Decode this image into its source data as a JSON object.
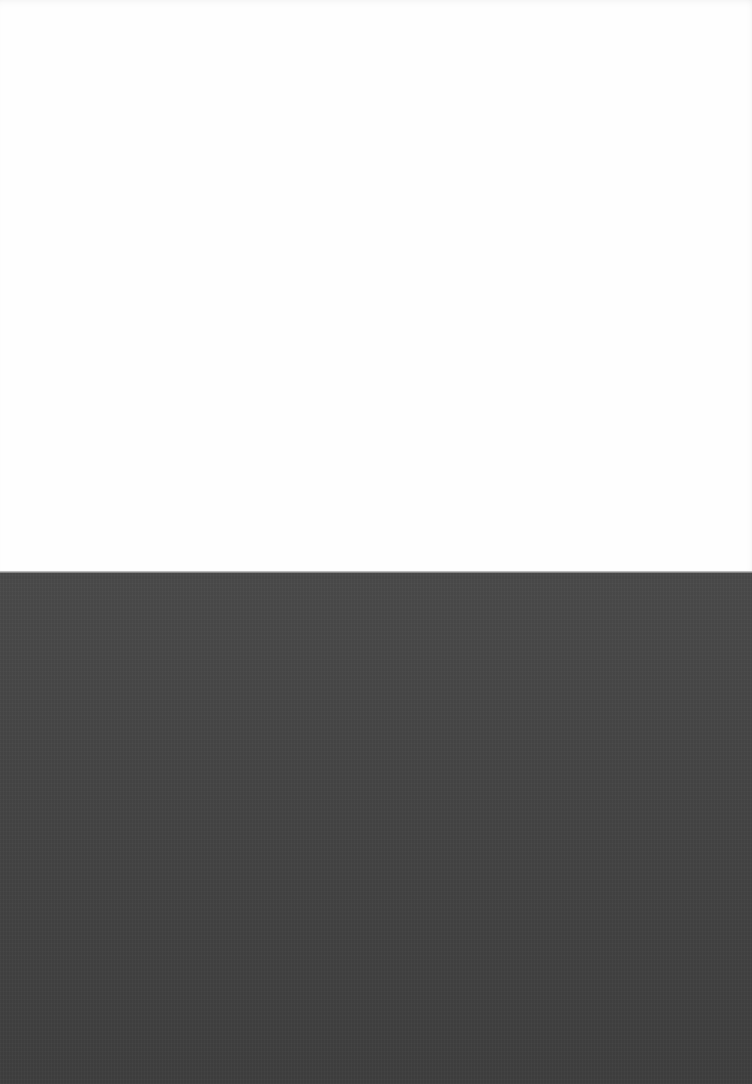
{
  "scene": {
    "description": "Blank white sheet on dark surface",
    "regions": [
      {
        "name": "paper",
        "color": "#fefefe",
        "top": 0,
        "height": 572
      },
      {
        "name": "surface",
        "color": "#464646",
        "top": 573,
        "height": 511
      }
    ]
  }
}
